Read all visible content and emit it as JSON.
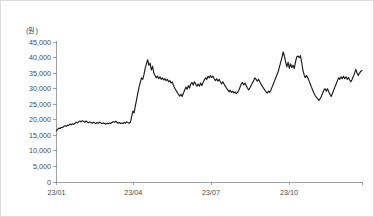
{
  "figure": {
    "background_color": "#ffffff",
    "border_color": "#dcdcdc",
    "unit_label": "(원)"
  },
  "chart_data": {
    "type": "line",
    "title": "",
    "subtitle": "",
    "xlabel": "",
    "ylabel": "(원)",
    "grid": false,
    "legend": false,
    "legend_position": "none",
    "line_color": "#1a1a1a",
    "axis_color": "#8a8a8a",
    "ylim": [
      0,
      45000
    ],
    "yticks": [
      0,
      5000,
      10000,
      15000,
      20000,
      25000,
      30000,
      35000,
      40000,
      45000
    ],
    "ytick_labels": [
      "0",
      "5,000",
      "10,000",
      "15,000",
      "20,000",
      "25,000",
      "30,000",
      "35,000",
      "40,000",
      "45,000"
    ],
    "xticks": [
      0,
      62,
      125,
      188
    ],
    "xtick_labels": [
      "23/01",
      "23/04",
      "23/07",
      "23/10"
    ],
    "xlim": [
      0,
      247
    ],
    "series": [
      {
        "name": "주가",
        "values": [
          16500,
          17000,
          17300,
          17200,
          17600,
          17500,
          17900,
          18100,
          17900,
          18300,
          18200,
          18600,
          18400,
          18700,
          18500,
          18900,
          19200,
          19000,
          19400,
          19600,
          19300,
          19700,
          19500,
          19200,
          19600,
          19300,
          19000,
          19300,
          19100,
          18900,
          19200,
          19000,
          18800,
          19100,
          18900,
          19200,
          19000,
          18800,
          19000,
          18800,
          18600,
          18900,
          18700,
          19000,
          18800,
          19100,
          19400,
          19200,
          19500,
          19200,
          18900,
          19100,
          18800,
          19000,
          18800,
          19100,
          18900,
          19300,
          19100,
          18900,
          19200,
          21000,
          22800,
          22200,
          24500,
          26500,
          28500,
          30500,
          32000,
          33500,
          33000,
          34500,
          36500,
          38000,
          39300,
          37500,
          38200,
          36000,
          37200,
          35000,
          34200,
          33500,
          34000,
          33200,
          33800,
          33000,
          33500,
          32800,
          33200,
          32600,
          33000,
          32200,
          32600,
          31800,
          32200,
          31000,
          30200,
          29500,
          28800,
          28200,
          27600,
          28200,
          27500,
          28500,
          29500,
          30500,
          29800,
          31000,
          30200,
          31500,
          32000,
          31200,
          32200,
          31500,
          30800,
          31500,
          30800,
          31800,
          31000,
          32000,
          32800,
          33500,
          33000,
          34000,
          33500,
          34200,
          33600,
          34000,
          33200,
          32600,
          33200,
          32400,
          33000,
          32200,
          31500,
          32200,
          31500,
          30800,
          30200,
          29600,
          29000,
          29500,
          28800,
          29200,
          28600,
          29000,
          28400,
          28800,
          29500,
          30500,
          31500,
          32000,
          31200,
          31800,
          31000,
          30200,
          29600,
          30200,
          31000,
          31800,
          32500,
          33500,
          33000,
          32400,
          33000,
          32200,
          31500,
          30800,
          30200,
          29600,
          29000,
          28600,
          29200,
          28800,
          29500,
          30500,
          31500,
          32500,
          33500,
          34500,
          35500,
          37000,
          38500,
          40000,
          41800,
          40500,
          38500,
          37000,
          38500,
          36500,
          38000,
          36800,
          37500,
          36500,
          38500,
          40200,
          40500,
          40000,
          40600,
          38500,
          36000,
          34500,
          33500,
          34200,
          33500,
          32500,
          31500,
          30500,
          29500,
          28500,
          27800,
          27200,
          26800,
          26200,
          26800,
          27500,
          28500,
          29500,
          30000,
          29200,
          30000,
          29000,
          28200,
          27500,
          28500,
          29500,
          30500,
          31500,
          32500,
          33500,
          33000,
          33800,
          33200,
          34000,
          33200,
          33800,
          33000,
          33600,
          32800,
          32200,
          33000,
          34000,
          35000,
          36200,
          35000,
          34200,
          35000,
          35600,
          35800
        ]
      }
    ]
  }
}
